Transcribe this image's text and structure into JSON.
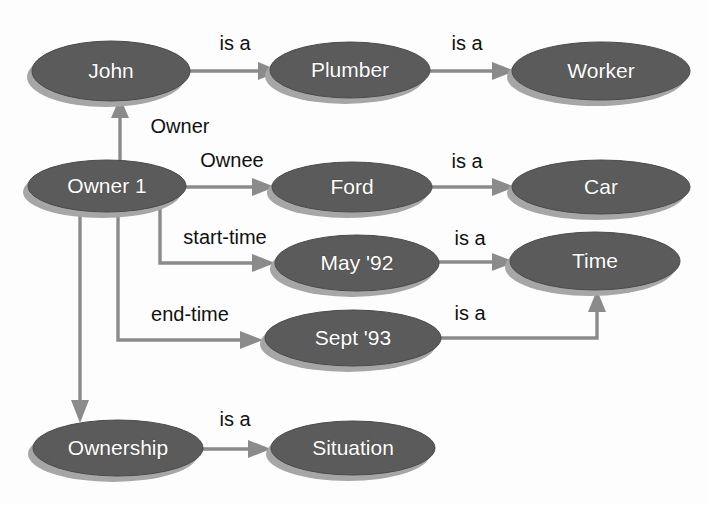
{
  "diagram": {
    "colors": {
      "node_fill": "#5b5b5b",
      "node_shadow": "#a6a6a6",
      "node_text": "#ffffff",
      "edge": "#8b8b8b",
      "edge_text": "#111111",
      "background": "#fdfdfd"
    },
    "nodes": [
      {
        "id": "john",
        "label": "John",
        "cx": 111,
        "cy": 71,
        "rx": 79,
        "ry": 30
      },
      {
        "id": "plumber",
        "label": "Plumber",
        "cx": 350,
        "cy": 70,
        "rx": 80,
        "ry": 28
      },
      {
        "id": "worker",
        "label": "Worker",
        "cx": 601,
        "cy": 71,
        "rx": 89,
        "ry": 29
      },
      {
        "id": "owner1",
        "label": "Owner 1",
        "cx": 107,
        "cy": 186,
        "rx": 79,
        "ry": 26
      },
      {
        "id": "ford",
        "label": "Ford",
        "cx": 352,
        "cy": 187,
        "rx": 80,
        "ry": 25
      },
      {
        "id": "car",
        "label": "Car",
        "cx": 601,
        "cy": 187,
        "rx": 89,
        "ry": 27
      },
      {
        "id": "may92",
        "label": "May '92",
        "cx": 357,
        "cy": 263,
        "rx": 82,
        "ry": 28
      },
      {
        "id": "time",
        "label": "Time",
        "cx": 595,
        "cy": 261,
        "rx": 85,
        "ry": 29
      },
      {
        "id": "sept93",
        "label": "Sept '93",
        "cx": 353,
        "cy": 338,
        "rx": 88,
        "ry": 28
      },
      {
        "id": "ownership",
        "label": "Ownership",
        "cx": 118,
        "cy": 448,
        "rx": 85,
        "ry": 28
      },
      {
        "id": "situation",
        "label": "Situation",
        "cx": 353,
        "cy": 448,
        "rx": 82,
        "ry": 27
      }
    ],
    "edges": [
      {
        "id": "john-isa-plumber",
        "label": "is a",
        "from": "john",
        "to": "plumber",
        "label_x": 235,
        "label_y": 45
      },
      {
        "id": "plumber-isa-worker",
        "label": "is a",
        "from": "plumber",
        "to": "worker",
        "label_x": 467,
        "label_y": 45
      },
      {
        "id": "owner1-owner-john",
        "label": "Owner",
        "from": "owner1",
        "to": "john",
        "label_x": 180,
        "label_y": 128
      },
      {
        "id": "owner1-ownee-ford",
        "label": "Ownee",
        "from": "owner1",
        "to": "ford",
        "label_x": 232,
        "label_y": 162
      },
      {
        "id": "ford-isa-car",
        "label": "is a",
        "from": "ford",
        "to": "car",
        "label_x": 467,
        "label_y": 163
      },
      {
        "id": "owner1-start-may92",
        "label": "start-time",
        "from": "owner1",
        "to": "may92",
        "label_x": 225,
        "label_y": 239
      },
      {
        "id": "may92-isa-time",
        "label": "is a",
        "from": "may92",
        "to": "time",
        "label_x": 470,
        "label_y": 240
      },
      {
        "id": "owner1-end-sept93",
        "label": "end-time",
        "from": "owner1",
        "to": "sept93",
        "label_x": 190,
        "label_y": 316
      },
      {
        "id": "sept93-isa-time",
        "label": "is a",
        "from": "sept93",
        "to": "time",
        "label_x": 470,
        "label_y": 315
      },
      {
        "id": "owner1-isa-ownership",
        "label": "",
        "from": "owner1",
        "to": "ownership",
        "label_x": 0,
        "label_y": 0
      },
      {
        "id": "ownership-isa-situation",
        "label": "is a",
        "from": "ownership",
        "to": "situation",
        "label_x": 235,
        "label_y": 421
      }
    ]
  }
}
